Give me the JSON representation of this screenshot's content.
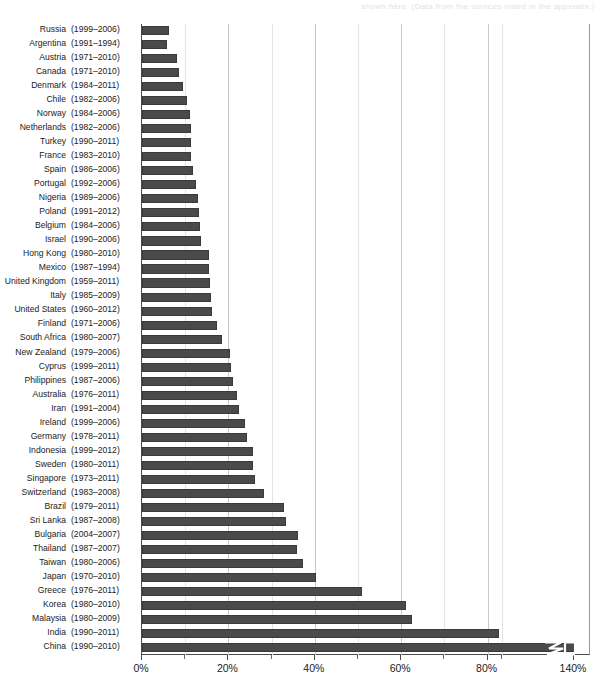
{
  "figure": {
    "bleed_text": "shown here. (Data from the sources noted in the appendix.)",
    "bar_color": "#4a4a4a",
    "axis_color": "#4a4a4a",
    "grid_color": "#c8c8c8"
  },
  "chart_data": {
    "type": "bar",
    "orientation": "horizontal",
    "title": "",
    "xlabel": "",
    "ylabel": "",
    "xlim": [
      0,
      140
    ],
    "grid": true,
    "legend": null,
    "axis_break": {
      "present": true,
      "note": "Axis is broken between the 80% tick and the 140% tick; the China bar is drawn with a zig-zag break marker.",
      "break_after_tick": "80%",
      "resume_tick": "140%"
    },
    "tick_labels": [
      "0%",
      "20%",
      "40%",
      "60%",
      "80%",
      "140%"
    ],
    "tick_values": [
      0,
      20,
      40,
      60,
      80,
      140
    ],
    "minor_tick_values": [
      10,
      30,
      50,
      70,
      90
    ],
    "categories": [
      "Russia",
      "Argentina",
      "Austria",
      "Canada",
      "Denmark",
      "Chile",
      "Norway",
      "Netherlands",
      "Turkey",
      "France",
      "Spain",
      "Portugal",
      "Nigeria",
      "Poland",
      "Belgium",
      "Israel",
      "Hong Kong",
      "Mexico",
      "United Kingdom",
      "Italy",
      "United States",
      "Finland",
      "South Africa",
      "New Zealand",
      "Cyprus",
      "Philippines",
      "Australia",
      "Iran",
      "Ireland",
      "Germany",
      "Indonesia",
      "Sweden",
      "Singapore",
      "Switzerland",
      "Brazil",
      "Sri Lanka",
      "Bulgaria",
      "Thailand",
      "Taiwan",
      "Japan",
      "Greece",
      "Korea",
      "Malaysia",
      "India",
      "China"
    ],
    "year_ranges": [
      "(1999–2006)",
      "(1991–1994)",
      "(1971–2010)",
      "(1971–2010)",
      "(1984–2011)",
      "(1982–2006)",
      "(1984–2006)",
      "(1982–2006)",
      "(1990–2011)",
      "(1983–2010)",
      "(1986–2006)",
      "(1992–2006)",
      "(1989–2006)",
      "(1991–2012)",
      "(1984–2006)",
      "(1990–2006)",
      "(1980–2010)",
      "(1987–1994)",
      "(1959–2011)",
      "(1985–2009)",
      "(1960–2012)",
      "(1971–2006)",
      "(1980–2007)",
      "(1979–2006)",
      "(1999–2011)",
      "(1987–2006)",
      "(1976–2011)",
      "(1991–2004)",
      "(1999–2006)",
      "(1978–2011)",
      "(1999–2012)",
      "(1980–2011)",
      "(1973–2011)",
      "(1983–2008)",
      "(1979–2011)",
      "(1987–2008)",
      "(2004–2007)",
      "(1987–2007)",
      "(1980–2006)",
      "(1970–2010)",
      "(1976–2011)",
      "(1980–2010)",
      "(1980–2009)",
      "(1990–2011)",
      "(1990–2010)"
    ],
    "values": [
      6.3,
      5.8,
      8.0,
      8.6,
      9.5,
      10.4,
      11.0,
      11.3,
      11.4,
      11.4,
      11.9,
      12.6,
      13.0,
      13.1,
      13.5,
      13.7,
      15.4,
      15.6,
      15.8,
      15.9,
      16.3,
      17.4,
      18.5,
      20.3,
      20.7,
      21.1,
      21.9,
      22.4,
      23.8,
      24.2,
      25.6,
      25.8,
      26.2,
      28.3,
      32.8,
      33.4,
      36.0,
      35.8,
      37.2,
      40.3,
      50.9,
      61.0,
      62.5,
      88.0,
      140.0
    ],
    "value_unit": "%",
    "clipped_bars": [
      "China"
    ]
  }
}
